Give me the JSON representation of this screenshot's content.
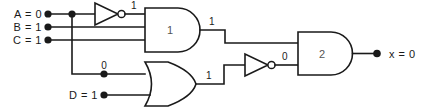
{
  "diagram": {
    "type": "combinational-logic-circuit",
    "colors": {
      "wire": "#1a1a1a",
      "background": "#ffffff",
      "gate_fill": "#ffffff",
      "gate_label": "#555555"
    }
  },
  "inputs": [
    {
      "name": "A",
      "label": "A = 0",
      "value": "0"
    },
    {
      "name": "B",
      "label": "B = 1",
      "value": "1"
    },
    {
      "name": "C",
      "label": "C = 1",
      "value": "1"
    },
    {
      "name": "D",
      "label": "D = 1",
      "value": "1"
    }
  ],
  "outputs": [
    {
      "name": "x",
      "label": "x = 0",
      "value": "0"
    }
  ],
  "gates": [
    {
      "id": "inv1",
      "type": "inverter",
      "label": "",
      "output_value": "1"
    },
    {
      "id": "and1",
      "type": "and",
      "label": "1",
      "output_value": "1"
    },
    {
      "id": "or1",
      "type": "or",
      "label": "",
      "output_value": "1"
    },
    {
      "id": "inv2",
      "type": "inverter",
      "label": "",
      "output_value": "0"
    },
    {
      "id": "and2",
      "type": "and",
      "label": "2",
      "output_value": "0"
    }
  ],
  "signal_labels": {
    "inv1_out": "1",
    "and1_out": "1",
    "or1_in_a": "0",
    "or1_out": "1",
    "inv2_out": "0"
  },
  "gate_numbers": {
    "and1": "1",
    "and2": "2"
  }
}
